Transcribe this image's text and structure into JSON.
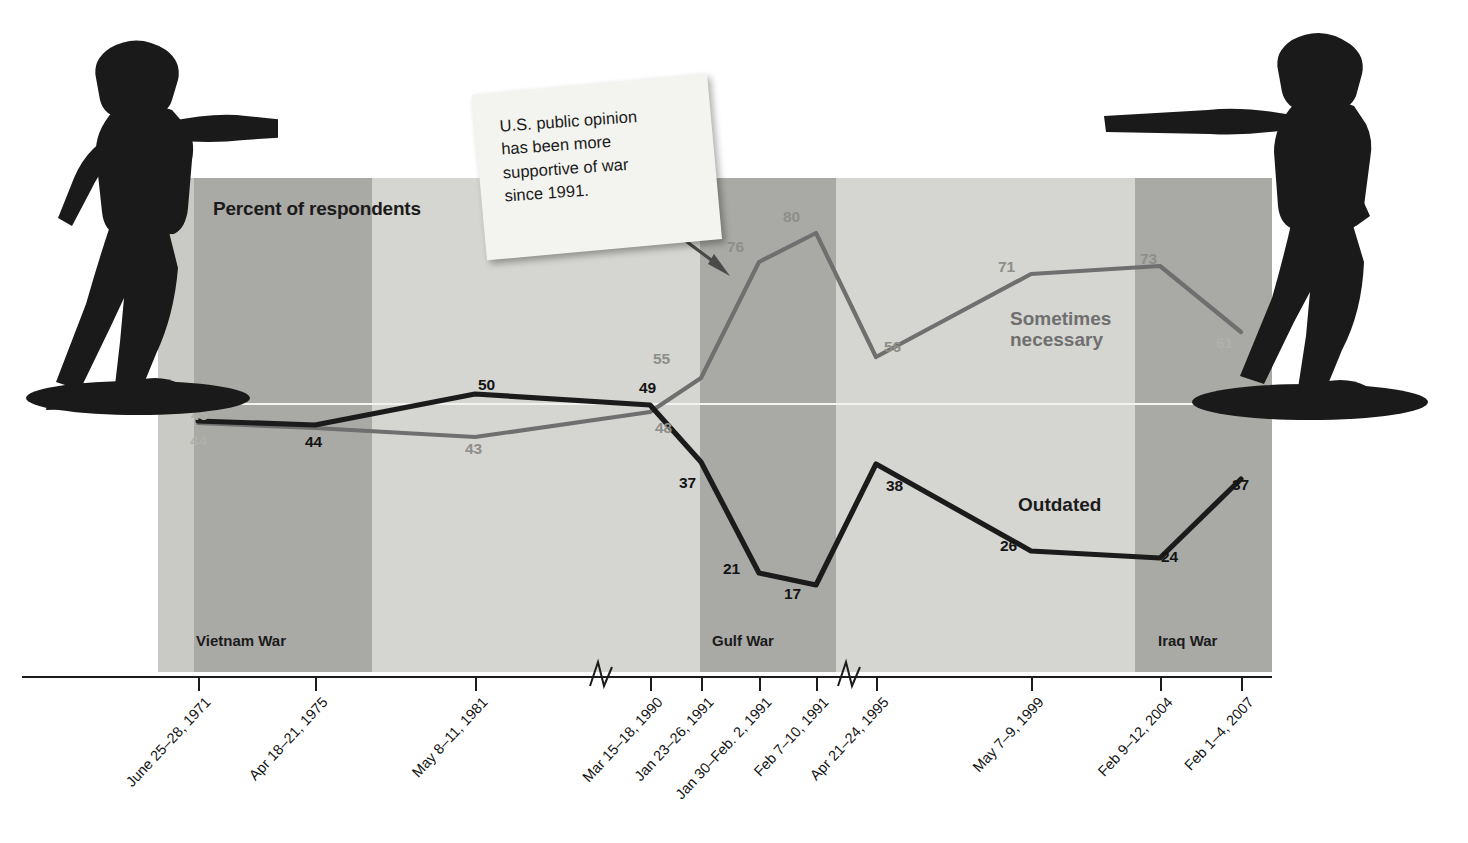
{
  "chart_data": {
    "type": "line",
    "title": "Percent of respondents",
    "xlabel": "",
    "ylabel": "Percent of respondents",
    "ylim": [
      0,
      100
    ],
    "grid": false,
    "reference_line": 50,
    "legend_position": "inline-annotation",
    "categories": [
      "June 25–28, 1971",
      "Apr 18–21, 1975",
      "May 8–11, 1981",
      "Mar 15–18, 1990",
      "Jan 23–26, 1991",
      "Jan 30–Feb. 2, 1991",
      "Feb 7–10, 1991",
      "Apr 21–24, 1995",
      "May 7–9, 1999",
      "Feb 9–12, 2004",
      "Feb 1–4, 2007"
    ],
    "series": [
      {
        "name": "Sometimes necessary",
        "color": "#6f6f6f",
        "values": [
          45,
          44,
          43,
          48,
          55,
          76,
          80,
          56,
          71,
          73,
          61
        ]
      },
      {
        "name": "Outdated",
        "color": "#1b1b1b",
        "values": [
          46,
          44,
          50,
          49,
          37,
          21,
          17,
          38,
          26,
          24,
          37
        ]
      }
    ],
    "annotations": [
      {
        "name": "callout",
        "text": "U.S. public opinion has been more supportive of war since 1991.",
        "points_to": "Jan 23–26, 1991"
      }
    ],
    "shaded_bands": [
      {
        "label": "Vietnam War",
        "shade": "dark"
      },
      {
        "label": "Gulf War",
        "shade": "dark"
      },
      {
        "label": "Iraq War",
        "shade": "dark"
      }
    ],
    "axis_breaks": 2
  },
  "chart": {
    "title": "Percent of respondents",
    "series_labels": {
      "gray_line_1": "Sometimes",
      "gray_line_2": "necessary",
      "dark_line": "Outdated"
    },
    "callout": {
      "line1": "U.S. public opinion",
      "line2": "has been more",
      "line3": "supportive of war",
      "line4": "since 1991."
    },
    "war_bands": [
      {
        "label": "Vietnam War",
        "left": 36,
        "width": 178,
        "shade": "dark"
      },
      {
        "label": "Gulf War",
        "left": 542,
        "width": 136,
        "shade": "dark"
      },
      {
        "label": "Iraq War",
        "left": 977,
        "width": 137,
        "shade": "dark"
      }
    ],
    "x_ticks": [
      {
        "label": "June 25–28, 1971",
        "x": 198
      },
      {
        "label": "Apr 18–21, 1975",
        "x": 315
      },
      {
        "label": "May 8–11, 1981",
        "x": 475
      },
      {
        "label": "Mar 15–18, 1990",
        "x": 650
      },
      {
        "label": "Jan 23–26, 1991",
        "x": 701
      },
      {
        "label": "Jan 30–Feb. 2, 1991",
        "x": 759
      },
      {
        "label": "Feb 7–10, 1991",
        "x": 816
      },
      {
        "label": "Apr 21–24, 1995",
        "x": 876
      },
      {
        "label": "May 7–9, 1999",
        "x": 1031
      },
      {
        "label": "Feb 9–12, 2004",
        "x": 1160
      },
      {
        "label": "Feb 1–4, 2007",
        "x": 1241
      }
    ],
    "gray_point_labels": [
      {
        "value": "45",
        "x": 191,
        "y": 406,
        "faint": true
      },
      {
        "value": "43",
        "x": 465,
        "y": 440,
        "faint": false
      },
      {
        "value": "48",
        "x": 655,
        "y": 419,
        "faint": false
      },
      {
        "value": "55",
        "x": 653,
        "y": 350,
        "faint": false
      },
      {
        "value": "76",
        "x": 727,
        "y": 238,
        "faint": false
      },
      {
        "value": "80",
        "x": 783,
        "y": 208,
        "faint": false
      },
      {
        "value": "56",
        "x": 884,
        "y": 338,
        "faint": false
      },
      {
        "value": "71",
        "x": 998,
        "y": 258,
        "faint": false
      },
      {
        "value": "73",
        "x": 1140,
        "y": 250,
        "faint": false
      },
      {
        "value": "61",
        "x": 1216,
        "y": 334,
        "faint": true
      }
    ],
    "dark_point_labels": [
      {
        "value": "44",
        "x": 190,
        "y": 432,
        "faint": true
      },
      {
        "value": "44",
        "x": 305,
        "y": 433,
        "faint": false
      },
      {
        "value": "50",
        "x": 478,
        "y": 376,
        "faint": false
      },
      {
        "value": "49",
        "x": 639,
        "y": 379,
        "faint": false
      },
      {
        "value": "37",
        "x": 679,
        "y": 474,
        "faint": false
      },
      {
        "value": "21",
        "x": 723,
        "y": 560,
        "faint": false
      },
      {
        "value": "17",
        "x": 784,
        "y": 585,
        "faint": false
      },
      {
        "value": "38",
        "x": 886,
        "y": 477,
        "faint": false
      },
      {
        "value": "26",
        "x": 1000,
        "y": 537,
        "faint": false
      },
      {
        "value": "24",
        "x": 1161,
        "y": 548,
        "faint": false
      },
      {
        "value": "37",
        "x": 1232,
        "y": 476,
        "faint": false
      }
    ]
  }
}
